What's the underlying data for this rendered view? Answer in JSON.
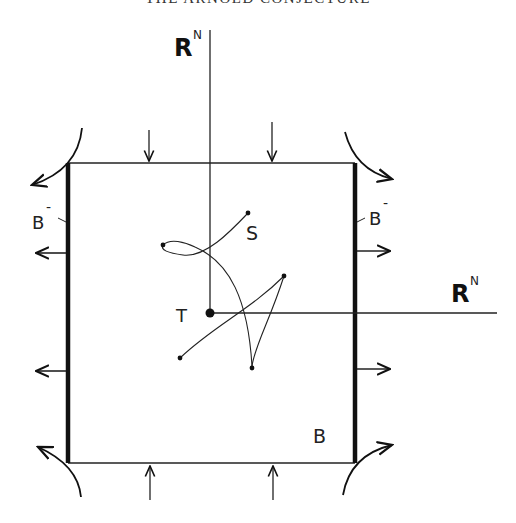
{
  "header": {
    "title": "THE ARNOLD CONJECTURE"
  },
  "diagram": {
    "labels": {
      "axis_vertical": "R",
      "axis_vertical_sup": "N",
      "axis_horizontal": "R",
      "axis_horizontal_sup": "N",
      "left_boundary": "B",
      "left_boundary_sup": "-",
      "right_boundary": "B",
      "right_boundary_sup": "-",
      "curve_start": "S",
      "origin_point": "T",
      "box": "B"
    },
    "colors": {
      "ink": "#111111",
      "background": "#ffffff"
    }
  }
}
